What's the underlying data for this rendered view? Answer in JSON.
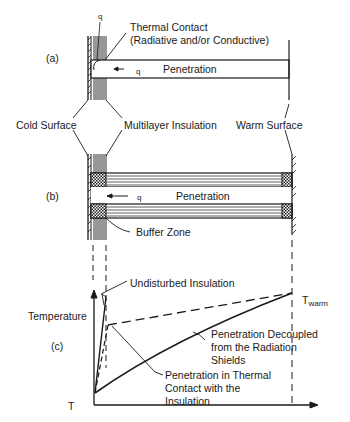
{
  "figure": {
    "panels": [
      {
        "id": "a",
        "label": "(a)"
      },
      {
        "id": "b",
        "label": "(b)"
      },
      {
        "id": "c",
        "label": "(c)"
      }
    ],
    "panel_a": {
      "heat_symbol_top": "q",
      "thermal_contact_line1": "Thermal Contact",
      "thermal_contact_line2": "(Radiative and/or Conductive)",
      "penetration_label": "Penetration",
      "heat_flow_label": "q"
    },
    "shared_labels": {
      "cold_surface": "Cold Surface",
      "multilayer_insulation": "Multilayer Insulation",
      "warm_surface": "Warm Surface"
    },
    "panel_b": {
      "penetration_label": "Penetration",
      "heat_flow_label": "q",
      "buffer_zone": "Buffer Zone"
    },
    "panel_c": {
      "y_axis_label": "Temperature",
      "x_origin_label": "T",
      "t_warm_prefix": "T",
      "t_warm_sub": "warm",
      "curve_undisturbed": "Undisturbed Insulation",
      "curve_decoupled_line1": "Penetration Decoupled",
      "curve_decoupled_line2": "from the Radiation",
      "curve_decoupled_line3": "Shields",
      "curve_contact_line1": "Penetration in Thermal",
      "curve_contact_line2": "Contact with the",
      "curve_contact_line3": "Insulation"
    }
  }
}
